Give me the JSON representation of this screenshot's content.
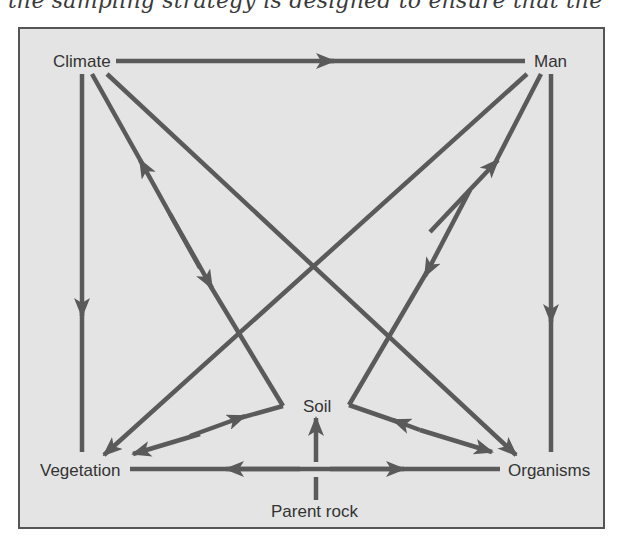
{
  "header_text": "the sampling strategy is designed to ensure that the",
  "diagram": {
    "colors": {
      "background": "#e4e4e4",
      "line": "#5a5a5a",
      "border": "#555555",
      "text": "#333333"
    },
    "nodes": [
      {
        "id": "climate",
        "label": "Climate"
      },
      {
        "id": "man",
        "label": "Man"
      },
      {
        "id": "vegetation",
        "label": "Vegetation"
      },
      {
        "id": "organisms",
        "label": "Organisms"
      },
      {
        "id": "soil",
        "label": "Soil"
      },
      {
        "id": "parent_rock",
        "label": "Parent rock"
      }
    ],
    "edges": [
      {
        "from": "Climate",
        "to": "Man",
        "arrow": "forward"
      },
      {
        "from": "Climate",
        "to": "Vegetation",
        "arrow": "forward"
      },
      {
        "from": "Climate",
        "to": "Soil",
        "arrow": "both",
        "via": "elbow-left"
      },
      {
        "from": "Soil",
        "to": "Vegetation",
        "arrow": "both"
      },
      {
        "from": "Climate",
        "to": "Organisms",
        "arrow": "forward"
      },
      {
        "from": "Man",
        "to": "Vegetation",
        "arrow": "forward"
      },
      {
        "from": "Man",
        "to": "Soil",
        "arrow": "both",
        "via": "elbow-right"
      },
      {
        "from": "Soil",
        "to": "Organisms",
        "arrow": "both"
      },
      {
        "from": "Man",
        "to": "Organisms",
        "arrow": "forward"
      },
      {
        "from": "Organisms",
        "to": "Vegetation",
        "arrow": "both"
      },
      {
        "from": "Parent rock",
        "to": "Soil",
        "arrow": "forward"
      }
    ]
  }
}
